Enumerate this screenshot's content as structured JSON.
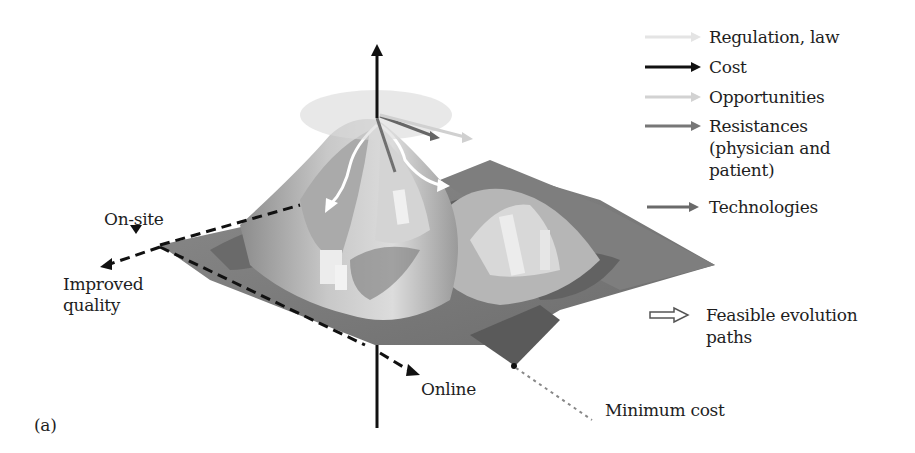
{
  "figure": {
    "panel_label": "(a)",
    "axes": {
      "on_site": "On-site",
      "improved_quality": [
        "Improved",
        "quality"
      ],
      "online": "Online"
    },
    "annotations": {
      "minimum_cost": "Minimum cost"
    },
    "legend": [
      {
        "label": "Regulation, law",
        "color": "#e4e4e4"
      },
      {
        "label": "Cost",
        "color": "#111111"
      },
      {
        "label": "Opportunities",
        "color": "#d2d2d2"
      },
      {
        "label": "Resistances",
        "color": "#777777",
        "extra_lines": [
          "(physician and",
          "patient)"
        ]
      },
      {
        "label": "Technologies",
        "color": "#6a6a6a"
      }
    ],
    "paths_legend": {
      "label": [
        "Feasible evolution",
        "paths"
      ],
      "icon": "hollow-arrow-icon"
    }
  }
}
